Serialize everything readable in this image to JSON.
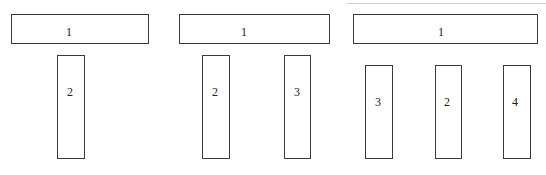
{
  "diagram": {
    "panels": [
      {
        "id": "panel-a",
        "top_box": {
          "label": "1",
          "x": 11,
          "y": 14,
          "w": 138,
          "h": 30,
          "label_x": 69,
          "label_y": 32
        },
        "bars": [
          {
            "label": "2",
            "x": 57,
            "y": 55,
            "w": 28,
            "h": 104,
            "label_x": 70,
            "label_y": 92
          }
        ]
      },
      {
        "id": "panel-b",
        "top_box": {
          "label": "1",
          "x": 179,
          "y": 14,
          "w": 151,
          "h": 30,
          "label_x": 244,
          "label_y": 32
        },
        "bars": [
          {
            "label": "2",
            "x": 202,
            "y": 55,
            "w": 28,
            "h": 104,
            "label_x": 215,
            "label_y": 92
          },
          {
            "label": "3",
            "x": 284,
            "y": 55,
            "w": 27,
            "h": 104,
            "label_x": 297,
            "label_y": 92
          }
        ]
      },
      {
        "id": "panel-c",
        "top_box": {
          "label": "1",
          "x": 353,
          "y": 14,
          "w": 185,
          "h": 30,
          "label_x": 441,
          "label_y": 32
        },
        "bars": [
          {
            "label": "3",
            "x": 365,
            "y": 65,
            "w": 28,
            "h": 94,
            "label_x": 378,
            "label_y": 102
          },
          {
            "label": "2",
            "x": 435,
            "y": 65,
            "w": 27,
            "h": 94,
            "label_x": 447,
            "label_y": 102
          },
          {
            "label": "4",
            "x": 503,
            "y": 65,
            "w": 28,
            "h": 94,
            "label_x": 515,
            "label_y": 102
          }
        ]
      }
    ],
    "colors": {
      "stroke": "#3a3a3a",
      "text": "#222222",
      "background": "#ffffff"
    }
  }
}
